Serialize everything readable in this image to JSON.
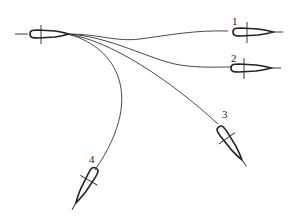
{
  "diagram": {
    "stroke_color": "#222222",
    "background": "#ffffff",
    "source": {
      "label": ""
    },
    "targets": [
      {
        "id": 1,
        "label": "1"
      },
      {
        "id": 2,
        "label": "2"
      },
      {
        "id": 3,
        "label": "3"
      },
      {
        "id": 4,
        "label": "4"
      }
    ]
  }
}
